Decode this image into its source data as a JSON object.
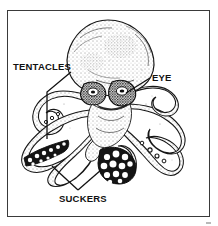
{
  "figure": {
    "style": "black-and-white stippled line drawing inside a rectangular frame",
    "frame_color": "#3a3a3a",
    "background_color": "#ffffff",
    "ink_color": "#111111"
  },
  "labels": {
    "tentacles": "TENTACLES",
    "eye": "EYE",
    "suckers": "SUCKERS"
  },
  "leader_lines": [
    {
      "name": "tentacles-leader",
      "from_label": "TENTACLES",
      "points": "71,72 47,92 47,139"
    },
    {
      "name": "eye-leader",
      "from_label": "EYE",
      "points": "150,78 126,93"
    },
    {
      "name": "suckers-leader-left",
      "from_label": "SUCKERS",
      "points": "78,190 52,166"
    },
    {
      "name": "suckers-leader-right",
      "from_label": "SUCKERS",
      "points": "78,190 101,170"
    }
  ],
  "subject": {
    "name": "octopus",
    "parts": [
      "mantle",
      "eyes",
      "arms",
      "suckers"
    ],
    "arm_count": 8
  }
}
